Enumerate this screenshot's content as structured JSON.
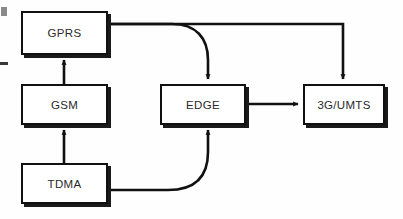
{
  "diagram": {
    "background_color": "#fefefe",
    "line_color": "#111111",
    "box_border_color": "#111111",
    "box_fill_color": "#ffffff",
    "shadow_color": "#1a1a1a",
    "text_color": "#2a2a2a",
    "nodes": [
      {
        "id": "gprs",
        "label": "GPRS",
        "x": 21,
        "y": 11,
        "w": 87,
        "h": 44
      },
      {
        "id": "gsm",
        "label": "GSM",
        "x": 21,
        "y": 84,
        "w": 87,
        "h": 41
      },
      {
        "id": "tdma",
        "label": "TDMA",
        "x": 21,
        "y": 163,
        "w": 87,
        "h": 41
      },
      {
        "id": "edge",
        "label": "EDGE",
        "x": 160,
        "y": 84,
        "w": 86,
        "h": 41
      },
      {
        "id": "3gumts",
        "label": "3G/UMTS",
        "x": 303,
        "y": 84,
        "w": 82,
        "h": 41
      }
    ],
    "edges": [
      {
        "id": "tdma-to-gsm",
        "from": "TDMA",
        "to": "GSM",
        "style": "straight-vertical",
        "direction": "up"
      },
      {
        "id": "gsm-to-gprs",
        "from": "GSM",
        "to": "GPRS",
        "style": "straight-vertical",
        "direction": "up"
      },
      {
        "id": "gprs-to-edge",
        "from": "GPRS",
        "to": "EDGE",
        "style": "curved",
        "direction": "down"
      },
      {
        "id": "gprs-to-3g",
        "from": "GPRS",
        "to": "3G/UMTS",
        "style": "orthogonal",
        "direction": "down"
      },
      {
        "id": "tdma-to-edge",
        "from": "TDMA",
        "to": "EDGE",
        "style": "curved",
        "direction": "up"
      },
      {
        "id": "edge-to-3g",
        "from": "EDGE",
        "to": "3G/UMTS",
        "style": "straight-horizontal",
        "direction": "right"
      }
    ],
    "artifacts": [
      {
        "id": "edge-mark-top",
        "x": 1,
        "y": 7,
        "w": 6,
        "h": 9,
        "kind": "block"
      },
      {
        "id": "edge-mark-bottom",
        "x": 0,
        "y": 62,
        "w": 8,
        "h": 3,
        "kind": "dash"
      }
    ]
  }
}
